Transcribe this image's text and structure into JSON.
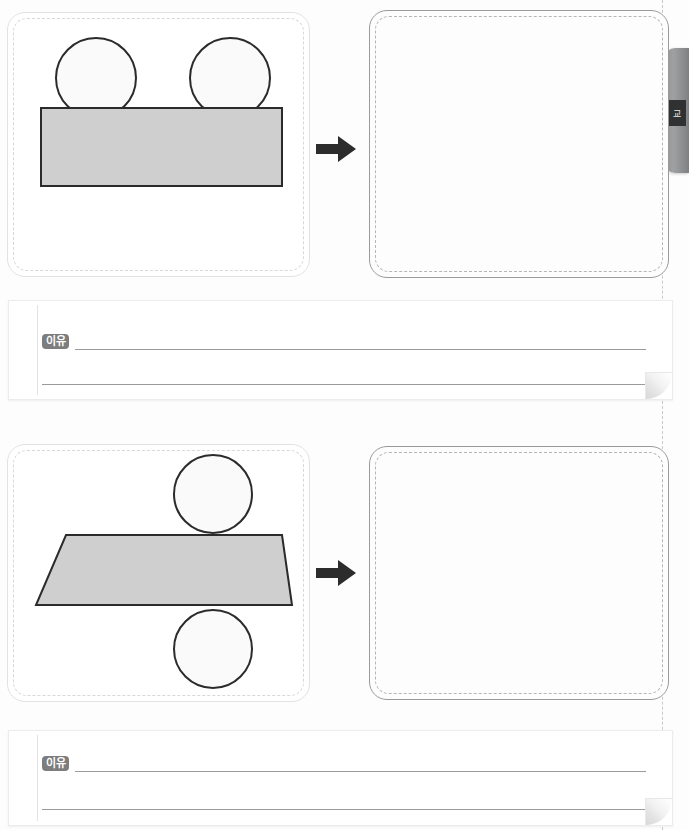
{
  "page": {
    "background_color": "#fdfdfd",
    "width": 689,
    "height": 830
  },
  "side_tab": {
    "label": "교",
    "color": "#8f9193",
    "label_bg": "#2f3133"
  },
  "problems": [
    {
      "id": "problem-1",
      "arrow_icon": "arrow-right-icon",
      "figure": {
        "caption": "",
        "shapes": [
          {
            "type": "circle",
            "name": "circle-left",
            "fill": "#fafafa",
            "stroke": "#2b2b2b",
            "cx": 88,
            "cy": 65,
            "r": 41
          },
          {
            "type": "circle",
            "name": "circle-right",
            "fill": "#fafafa",
            "stroke": "#2b2b2b",
            "cx": 222,
            "cy": 65,
            "r": 41
          },
          {
            "type": "rect",
            "name": "rectangle-base",
            "fill": "#cfcfcf",
            "stroke": "#2b2b2b",
            "x": 39,
            "y": 107,
            "w": 243,
            "h": 80
          }
        ]
      },
      "answer_area": {
        "label": "",
        "value": ""
      },
      "reason": {
        "badge": "이유",
        "line_1": "",
        "line_2": ""
      }
    },
    {
      "id": "problem-2",
      "arrow_icon": "arrow-right-icon",
      "figure": {
        "caption": "",
        "shapes": [
          {
            "type": "circle",
            "name": "circle-top",
            "fill": "#fafafa",
            "stroke": "#2b2b2b",
            "cx": 204,
            "cy": 493,
            "r": 40
          },
          {
            "type": "circle",
            "name": "circle-bottom",
            "fill": "#fafafa",
            "stroke": "#2b2b2b",
            "cx": 204,
            "cy": 648,
            "r": 40
          },
          {
            "type": "trapezoid",
            "name": "trapezoid-base",
            "fill": "#cfcfcf",
            "stroke": "#2b2b2b",
            "points": "72,0 250,0 285,70 0,70"
          }
        ]
      },
      "answer_area": {
        "label": "",
        "value": ""
      },
      "reason": {
        "badge": "이유",
        "line_1": "",
        "line_2": ""
      }
    }
  ],
  "colors": {
    "shape_fill": "#cfcfcf",
    "shape_stroke": "#2b2b2b",
    "panel_border_left": "#e2e2e2",
    "panel_border_right": "#9a9a9a",
    "badge_bg": "#7d7d7d",
    "write_line": "#9b9b9b"
  }
}
